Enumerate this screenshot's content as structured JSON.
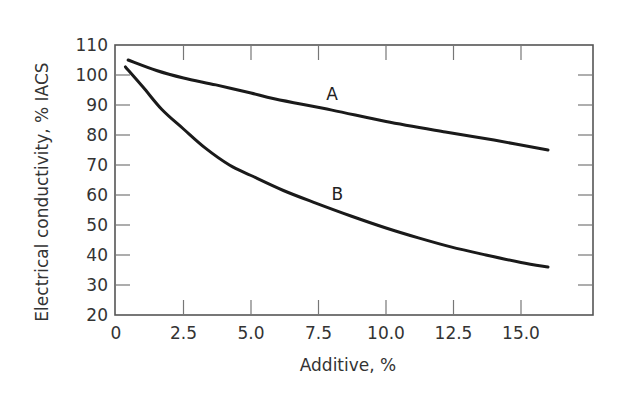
{
  "chart_data": {
    "type": "line",
    "title": "",
    "xlabel": "Additive, %",
    "ylabel": "Electrical conductivity, % IACS",
    "xlim": [
      0,
      17.7
    ],
    "ylim": [
      20,
      110
    ],
    "grid": false,
    "legend": "inline curve labels",
    "x_ticks": [
      "0",
      "2.5",
      "5.0",
      "7.5",
      "10.0",
      "12.5",
      "15.0"
    ],
    "x_tick_values": [
      0,
      2.5,
      5.0,
      7.5,
      10.0,
      12.5,
      15.0
    ],
    "y_ticks": [
      "20",
      "30",
      "40",
      "50",
      "60",
      "70",
      "80",
      "90",
      "100",
      "110"
    ],
    "y_tick_values": [
      20,
      30,
      40,
      50,
      60,
      70,
      80,
      90,
      100,
      110
    ],
    "series": [
      {
        "name": "A",
        "label_pos": {
          "x": 8.0,
          "y": 93.7
        },
        "points": [
          [
            0.45,
            105
          ],
          [
            1.5,
            101.5
          ],
          [
            2.5,
            99
          ],
          [
            3.7,
            96.7
          ],
          [
            5,
            94
          ],
          [
            5.9,
            92
          ],
          [
            8,
            88.3
          ],
          [
            10,
            84.5
          ],
          [
            12.2,
            81
          ],
          [
            14,
            78.3
          ],
          [
            16,
            75
          ]
        ]
      },
      {
        "name": "B",
        "label_pos": {
          "x": 8.2,
          "y": 60.3
        },
        "points": [
          [
            0.35,
            102.7
          ],
          [
            1,
            96
          ],
          [
            1.7,
            88.5
          ],
          [
            2.5,
            82
          ],
          [
            3.3,
            75.7
          ],
          [
            4.2,
            70
          ],
          [
            5,
            66.5
          ],
          [
            6.2,
            61.5
          ],
          [
            7.4,
            57.3
          ],
          [
            8.7,
            53
          ],
          [
            10,
            49
          ],
          [
            11.2,
            45.7
          ],
          [
            12.4,
            42.7
          ],
          [
            13.7,
            40
          ],
          [
            15,
            37.5
          ],
          [
            16,
            36
          ]
        ]
      }
    ]
  }
}
